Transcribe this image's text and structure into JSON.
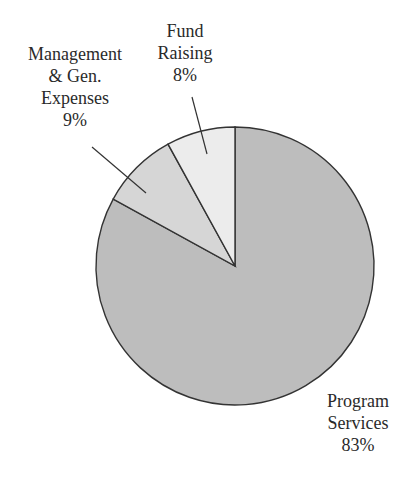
{
  "chart_data": {
    "type": "pie",
    "title": "",
    "categories": [
      "Program Services",
      "Management & Gen. Expenses",
      "Fund Raising"
    ],
    "values": [
      83,
      9,
      8
    ],
    "unit": "%",
    "colors": [
      "#bdbdbd",
      "#d6d6d6",
      "#ececec"
    ],
    "labels": [
      {
        "lines": [
          "Program",
          "Services"
        ],
        "value": "83%"
      },
      {
        "lines": [
          "Management",
          "& Gen.",
          "Expenses"
        ],
        "value": "9%"
      },
      {
        "lines": [
          "Fund",
          "Raising"
        ],
        "value": "8%"
      }
    ],
    "legend": "none (callout labels)"
  }
}
